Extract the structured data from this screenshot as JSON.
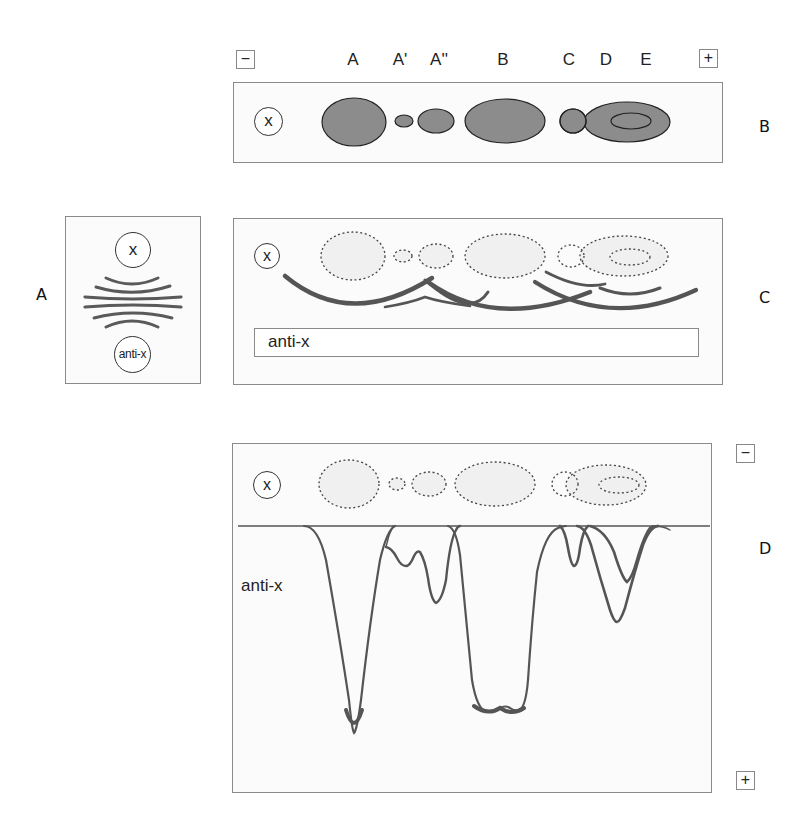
{
  "figure": {
    "panel_labels": {
      "a": "A",
      "b": "B",
      "c": "C",
      "d": "D"
    },
    "colors": {
      "stroke": "#333333",
      "fill_dark": "#8c8c8c",
      "fill_light": "#efefef",
      "arc": "#5a5a5a",
      "border": "#8a8a8a"
    }
  },
  "panel_b": {
    "minus_label": "−",
    "plus_label": "+",
    "well_label": "x",
    "bands": [
      {
        "label": "A"
      },
      {
        "label": "A'"
      },
      {
        "label": "A''"
      },
      {
        "label": "B"
      },
      {
        "label": "C"
      },
      {
        "label": "D"
      },
      {
        "label": "E"
      }
    ]
  },
  "panel_a": {
    "top_well_label": "x",
    "bottom_well_label": "anti-x"
  },
  "panel_c": {
    "well_label": "x",
    "trough_label": "anti-x"
  },
  "panel_d": {
    "well_label": "x",
    "antiserum_label": "anti-x",
    "minus_label": "−",
    "plus_label": "+"
  }
}
